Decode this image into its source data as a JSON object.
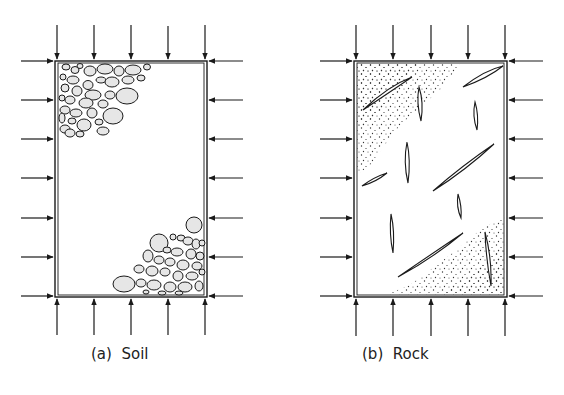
{
  "figure": {
    "panels": [
      {
        "id": "a",
        "letter": "a",
        "label": "Soil",
        "caption_prefix": "(",
        "caption_suffix": ")",
        "fill": "granular particles (rounded grains) clustered in top-left and bottom-right corners",
        "box": {
          "x": 55,
          "y": 61,
          "w": 152,
          "h": 236
        },
        "top_arrows_x": [
          57,
          94,
          131,
          168,
          205
        ],
        "bottom_arrows_x": [
          57,
          94,
          131,
          168,
          205
        ],
        "side_arrows_y": [
          61,
          100,
          139,
          178,
          218,
          257,
          296
        ]
      },
      {
        "id": "b",
        "letter": "b",
        "label": "Rock",
        "caption_prefix": "(",
        "caption_suffix": ")",
        "fill": "stippled continuous matrix with lens-shaped discontinuities (cracks/joints)",
        "box": {
          "x": 354,
          "y": 61,
          "w": 153,
          "h": 236
        },
        "top_arrows_x": [
          356,
          393,
          431,
          468,
          505
        ],
        "bottom_arrows_x": [
          356,
          393,
          431,
          468,
          505
        ],
        "side_arrows_y": [
          61,
          100,
          139,
          178,
          218,
          257,
          296
        ]
      }
    ],
    "colors": {
      "line": "#1a1a1a",
      "grain_fill": "#e6e6e6",
      "stipple": "#333333",
      "background": "#ffffff"
    }
  }
}
